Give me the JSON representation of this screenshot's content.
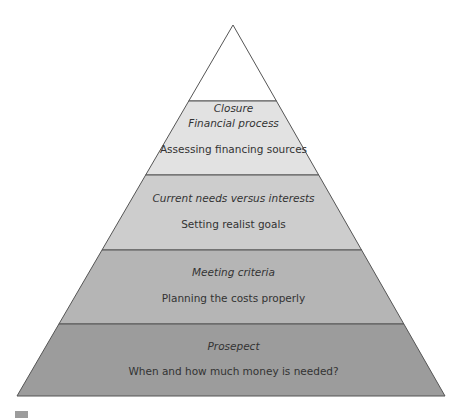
{
  "diagram": {
    "type": "pyramid",
    "apex": [
      233,
      25
    ],
    "base_y": 396,
    "base_left_x": 17,
    "base_right_x": 445,
    "outline_color": "#555555",
    "layers": [
      {
        "title": "Closure",
        "subtitle": "",
        "top_y": 25,
        "bottom_y": 101,
        "color": "#ffffff",
        "title_y": 108,
        "subtitle_y": null
      },
      {
        "title": "Financial process",
        "subtitle": "Assessing financing sources",
        "top_y": 101,
        "bottom_y": 175,
        "color": "#e2e2e2",
        "title_y": 117,
        "subtitle_y": 143
      },
      {
        "title": "Current needs versus interests",
        "subtitle": "Setting realist goals",
        "top_y": 175,
        "bottom_y": 250,
        "color": "#cdcdcd",
        "title_y": 192,
        "subtitle_y": 218
      },
      {
        "title": "Meeting criteria",
        "subtitle": "Planning the costs properly",
        "top_y": 250,
        "bottom_y": 324,
        "color": "#b5b5b5",
        "title_y": 266,
        "subtitle_y": 292
      },
      {
        "title": "Prosepect",
        "subtitle": "When and how much money is needed?",
        "top_y": 324,
        "bottom_y": 396,
        "color": "#9c9c9c",
        "title_y": 340,
        "subtitle_y": 365
      }
    ]
  },
  "labels": {
    "closure_title": "Closure",
    "financial_title": "Financial process",
    "financial_sub": "Assessing financing sources",
    "current_title": "Current needs versus interests",
    "current_sub": "Setting realist goals",
    "meeting_title": "Meeting criteria",
    "meeting_sub": "Planning the costs properly",
    "prospect_title": "Prosepect",
    "prospect_sub": "When and how much money is needed?"
  }
}
